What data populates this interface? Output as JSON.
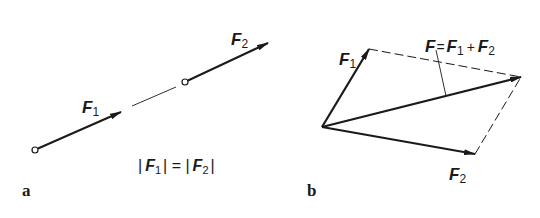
{
  "panels": {
    "a": {
      "label": "a",
      "vectors": [
        {
          "name": "F",
          "subscript": "1"
        },
        {
          "name": "F",
          "subscript": "2"
        }
      ],
      "equation": {
        "left_bar": "|",
        "left_name": "F",
        "left_sub": "1",
        "mid": "| = |",
        "right_name": "F",
        "right_sub": "2",
        "right_bar": "|"
      }
    },
    "b": {
      "label": "b",
      "vectors": [
        {
          "name": "F",
          "subscript": "1"
        },
        {
          "name": "F",
          "subscript": "2"
        }
      ],
      "resultant": {
        "name": "F",
        "eq": "=",
        "t1_name": "F",
        "t1_sub": "1",
        "plus": "+",
        "t2_name": "F",
        "t2_sub": "2"
      }
    }
  },
  "colors": {
    "ink": "#1a1a1a",
    "background": "#ffffff"
  }
}
